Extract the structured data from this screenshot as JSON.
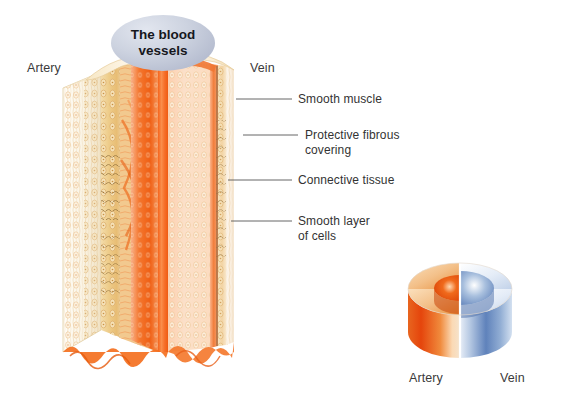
{
  "figure": {
    "type": "anatomical-illustration",
    "background_color": "#ffffff",
    "title_badge": {
      "text": "The blood\nvessels",
      "fill_color": "#c2c8d8",
      "text_color": "#16171c"
    },
    "main_diagram": {
      "description": "Cut-away three-dimensional view of an artery and a vein side by side showing the vessel wall layers",
      "left_label": "Artery",
      "right_label": "Vein",
      "artery_colors": {
        "outer_fibrous": "#f7efdd",
        "muscle_layer": "#edc98a",
        "connective": "#e9ab5e",
        "inner_lining": "#f2641f",
        "lumen": "#f4804a"
      },
      "vein_colors": {
        "outer_fibrous": "#fbf4ea",
        "muscle_layer": "#f4d9ab",
        "inner_lining": "#ef7434",
        "lumen": "#f8a273"
      }
    },
    "callouts": [
      {
        "label": "Smooth muscle",
        "line_y": 99,
        "line_x_start": 236,
        "line_x_end": 292
      },
      {
        "label": "Protective fibrous\ncovering",
        "line_y": 135,
        "line_x_start": 243,
        "line_x_end": 298
      },
      {
        "label": "Connective tissue",
        "line_y": 180,
        "line_x_start": 228,
        "line_x_end": 292
      },
      {
        "label": "Smooth layer\nof cells",
        "line_y": 221,
        "line_x_start": 231,
        "line_x_end": 292
      }
    ],
    "inset_diagram": {
      "description": "Small cylinder split vertically, orange artery half with thick wall and narrow lumen, blue vein half with thin wall and wide lumen",
      "artery_label": "Artery",
      "vein_label": "Vein",
      "artery_color": "#e8521a",
      "artery_highlight": "#f6c89a",
      "vein_color": "#4a6fae",
      "vein_highlight": "#cfdcef"
    },
    "leader_line_color": "#555555"
  }
}
